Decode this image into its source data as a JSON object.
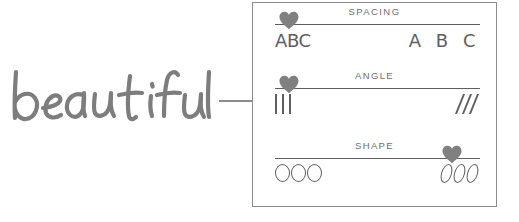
{
  "wordmark": {
    "text": "beautiful",
    "color": "#7d7d7d"
  },
  "connector": {
    "color": "#8c8c8c"
  },
  "panel": {
    "border_color": "#8c8c8c",
    "background": "#ffffff",
    "accent_color": "#7a7a7a",
    "track_color": "#5e5e5e",
    "label_color": "#6f6f6f",
    "sliders": [
      {
        "label": "SPACING",
        "handle_position_pct": 0,
        "preview_left": "ABC",
        "preview_right": "A B C",
        "preview_type": "text",
        "handle_icon": "heart-icon"
      },
      {
        "label": "ANGLE",
        "handle_position_pct": 0,
        "preview_left": "|||",
        "preview_right": "///",
        "preview_type": "bars",
        "handle_icon": "heart-icon"
      },
      {
        "label": "SHAPE",
        "handle_position_pct": 100,
        "preview_left": "OOO",
        "preview_right": "000",
        "preview_type": "rings",
        "handle_icon": "heart-icon"
      }
    ]
  }
}
